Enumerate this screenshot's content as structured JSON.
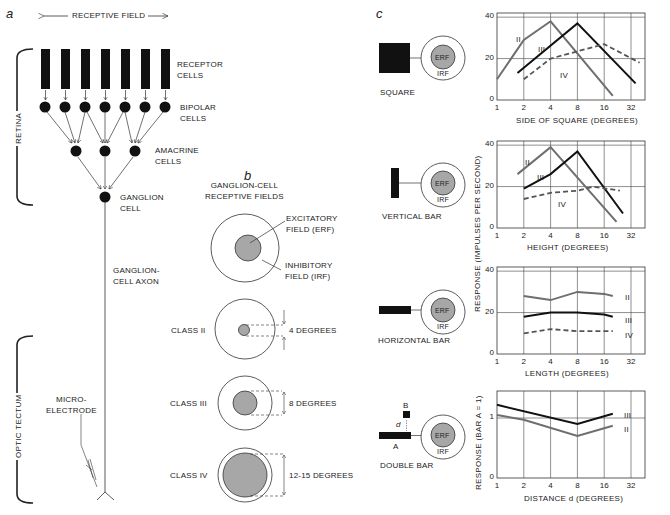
{
  "panel_a": {
    "letter": "a",
    "receptive_field": "RECEPTIVE FIELD",
    "retina": "RETINA",
    "optic_tectum": "OPTIC TECTUM",
    "receptor_cells": [
      "RECEPTOR",
      "CELLS"
    ],
    "bipolar_cells": [
      "BIPOLAR",
      "CELLS"
    ],
    "amacrine_cells": [
      "AMACRINE",
      "CELLS"
    ],
    "ganglion_cell": [
      "GANGLION",
      "CELL"
    ],
    "ganglion_axon": [
      "GANGLION-",
      "CELL AXON"
    ],
    "microelectrode": [
      "MICRO-",
      "ELECTRODE"
    ]
  },
  "panel_b": {
    "letter": "b",
    "title": [
      "GANGLION-CELL",
      "RECEPTIVE FIELDS"
    ],
    "excitatory": [
      "EXCITATORY",
      "FIELD (ERF)"
    ],
    "inhibitory": [
      "INHIBITORY",
      "FIELD (IRF)"
    ],
    "classes": [
      {
        "label": "CLASS II",
        "size": "4 DEGREES"
      },
      {
        "label": "CLASS III",
        "size": "8 DEGREES"
      },
      {
        "label": "CLASS IV",
        "size": "12-15 DEGREES"
      }
    ]
  },
  "panel_c": {
    "letter": "c",
    "erf": "ERF",
    "irf": "IRF",
    "stimuli": [
      "SQUARE",
      "VERTICAL BAR",
      "HORIZONTAL BAR",
      "DOUBLE BAR"
    ],
    "double_bar_labels": {
      "a": "A",
      "b": "B",
      "d": "d"
    },
    "ylabel_impulses": "RESPONSE (IMPULSES PER SECOND)",
    "ylabel_ratio": "RESPONSE (BAR A = 1)",
    "x_ticks": [
      "1",
      "2",
      "4",
      "8",
      "16",
      "32"
    ],
    "series_labels": {
      "II": "II",
      "III": "III",
      "IV": "IV"
    }
  },
  "chart_data": [
    {
      "type": "line",
      "title": "Square",
      "xlabel": "SIDE OF SQUARE (DEGREES)",
      "ylabel": "RESPONSE (IMPULSES PER SECOND)",
      "xscale": "log2",
      "x_ticks": [
        1,
        2,
        4,
        8,
        16,
        32
      ],
      "y_ticks": [
        0,
        20,
        40
      ],
      "ylim": [
        0,
        42
      ],
      "grid": true,
      "series": [
        {
          "name": "II",
          "style": "solid-gray",
          "x": [
            1,
            2,
            4,
            20
          ],
          "y": [
            10,
            29,
            38,
            2
          ]
        },
        {
          "name": "III",
          "style": "solid-black",
          "x": [
            1.7,
            8,
            36
          ],
          "y": [
            13,
            37,
            8
          ]
        },
        {
          "name": "IV",
          "style": "dashed",
          "x": [
            2,
            4,
            16,
            40
          ],
          "y": [
            10,
            20,
            27,
            18
          ]
        }
      ]
    },
    {
      "type": "line",
      "title": "Vertical bar",
      "xlabel": "HEIGHT (DEGREES)",
      "ylabel": "RESPONSE (IMPULSES PER SECOND)",
      "xscale": "log2",
      "x_ticks": [
        1,
        2,
        4,
        8,
        16,
        32
      ],
      "y_ticks": [
        0,
        20,
        40
      ],
      "ylim": [
        0,
        42
      ],
      "grid": true,
      "series": [
        {
          "name": "II",
          "style": "solid-gray",
          "x": [
            1.7,
            4,
            22
          ],
          "y": [
            26,
            39,
            3
          ]
        },
        {
          "name": "III",
          "style": "solid-black",
          "x": [
            2,
            4,
            8,
            26
          ],
          "y": [
            19,
            26,
            37,
            7
          ]
        },
        {
          "name": "IV",
          "style": "dashed",
          "x": [
            2,
            4,
            8,
            12,
            24
          ],
          "y": [
            14,
            17,
            18,
            20,
            18
          ]
        }
      ]
    },
    {
      "type": "line",
      "title": "Horizontal bar",
      "xlabel": "LENGTH (DEGREES)",
      "ylabel": "RESPONSE (IMPULSES PER SECOND)",
      "xscale": "log2",
      "x_ticks": [
        1,
        2,
        4,
        8,
        16,
        32
      ],
      "y_ticks": [
        0,
        20,
        40
      ],
      "ylim": [
        0,
        42
      ],
      "grid": true,
      "series": [
        {
          "name": "II",
          "style": "solid-gray",
          "x": [
            2,
            4,
            8,
            16,
            20
          ],
          "y": [
            28,
            26,
            30,
            29,
            28
          ]
        },
        {
          "name": "III",
          "style": "solid-black",
          "x": [
            2,
            4,
            8,
            16,
            20
          ],
          "y": [
            18,
            20,
            20,
            19,
            18
          ]
        },
        {
          "name": "IV",
          "style": "dashed",
          "x": [
            2,
            4,
            8,
            16,
            20
          ],
          "y": [
            10,
            12,
            11,
            11,
            11
          ]
        }
      ]
    },
    {
      "type": "line",
      "title": "Double bar",
      "xlabel": "DISTANCE d (DEGREES)",
      "ylabel": "RESPONSE (BAR A = 1)",
      "xscale": "log2",
      "x_ticks": [
        1,
        2,
        4,
        8,
        16,
        32
      ],
      "y_ticks": [
        0,
        1
      ],
      "ylim": [
        0,
        1.45
      ],
      "grid": true,
      "series": [
        {
          "name": "III",
          "style": "solid-black",
          "x": [
            1,
            8,
            20
          ],
          "y": [
            1.22,
            0.9,
            1.07
          ]
        },
        {
          "name": "II",
          "style": "solid-gray",
          "x": [
            1,
            2,
            8,
            20
          ],
          "y": [
            1.05,
            0.97,
            0.7,
            0.87
          ]
        }
      ]
    }
  ]
}
